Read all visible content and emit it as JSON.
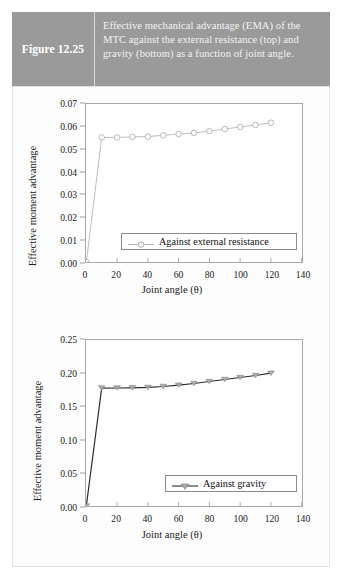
{
  "figure": {
    "number_label": "Figure 12.25",
    "caption": "Effective mechanical advantage (EMA) of the MTC against the external resistance (top) and gravity (bottom) as a function of joint angle.",
    "band_color": "#9a9a9a",
    "caption_text_color": "#f2f2f2"
  },
  "chart_data": [
    {
      "id": "top",
      "type": "line",
      "title": "",
      "xlabel": "Joint angle (θ)",
      "ylabel": "Effective moment advantage",
      "xlim": [
        0,
        140
      ],
      "ylim": [
        0,
        0.07
      ],
      "xticks": [
        0,
        20,
        40,
        60,
        80,
        100,
        120,
        140
      ],
      "xticklabels": [
        "0",
        "20",
        "40",
        "60",
        "80",
        "100",
        "120",
        "140"
      ],
      "yticks": [
        0.0,
        0.01,
        0.02,
        0.03,
        0.04,
        0.05,
        0.06,
        0.07
      ],
      "yticklabels": [
        "0.00",
        "0.01",
        "0.02",
        "0.03",
        "0.04",
        "0.05",
        "0.06",
        "0.07"
      ],
      "grid": false,
      "legend_position": "lower-right",
      "series": [
        {
          "name": "Against external resistance",
          "color": "#b6b6b6",
          "marker": "circle-open",
          "x": [
            0,
            10,
            20,
            30,
            40,
            50,
            60,
            70,
            80,
            90,
            100,
            110,
            120
          ],
          "y": [
            0.0,
            0.0552,
            0.0552,
            0.0554,
            0.0556,
            0.0561,
            0.0567,
            0.0572,
            0.058,
            0.0589,
            0.0598,
            0.0607,
            0.0617
          ]
        }
      ]
    },
    {
      "id": "bottom",
      "type": "line",
      "title": "",
      "xlabel": "Joint angle (θ)",
      "ylabel": "Effective moment advantage",
      "xlim": [
        0,
        140
      ],
      "ylim": [
        0,
        0.25
      ],
      "xticks": [
        0,
        20,
        40,
        60,
        80,
        100,
        120,
        140
      ],
      "xticklabels": [
        "0",
        "20",
        "40",
        "60",
        "80",
        "100",
        "120",
        "140"
      ],
      "yticks": [
        0.0,
        0.05,
        0.1,
        0.15,
        0.2,
        0.25
      ],
      "yticklabels": [
        "0.00",
        "0.05",
        "0.10",
        "0.15",
        "0.20",
        "0.25"
      ],
      "grid": false,
      "legend_position": "lower-right",
      "series": [
        {
          "name": "Against gravity",
          "color": "#2b2b2b",
          "marker": "triangle-down",
          "x": [
            0,
            10,
            20,
            30,
            40,
            50,
            60,
            70,
            80,
            90,
            100,
            110,
            120
          ],
          "y": [
            0.0,
            0.1775,
            0.1777,
            0.178,
            0.1786,
            0.18,
            0.182,
            0.1845,
            0.1875,
            0.1905,
            0.1935,
            0.1965,
            0.2
          ]
        }
      ]
    }
  ]
}
